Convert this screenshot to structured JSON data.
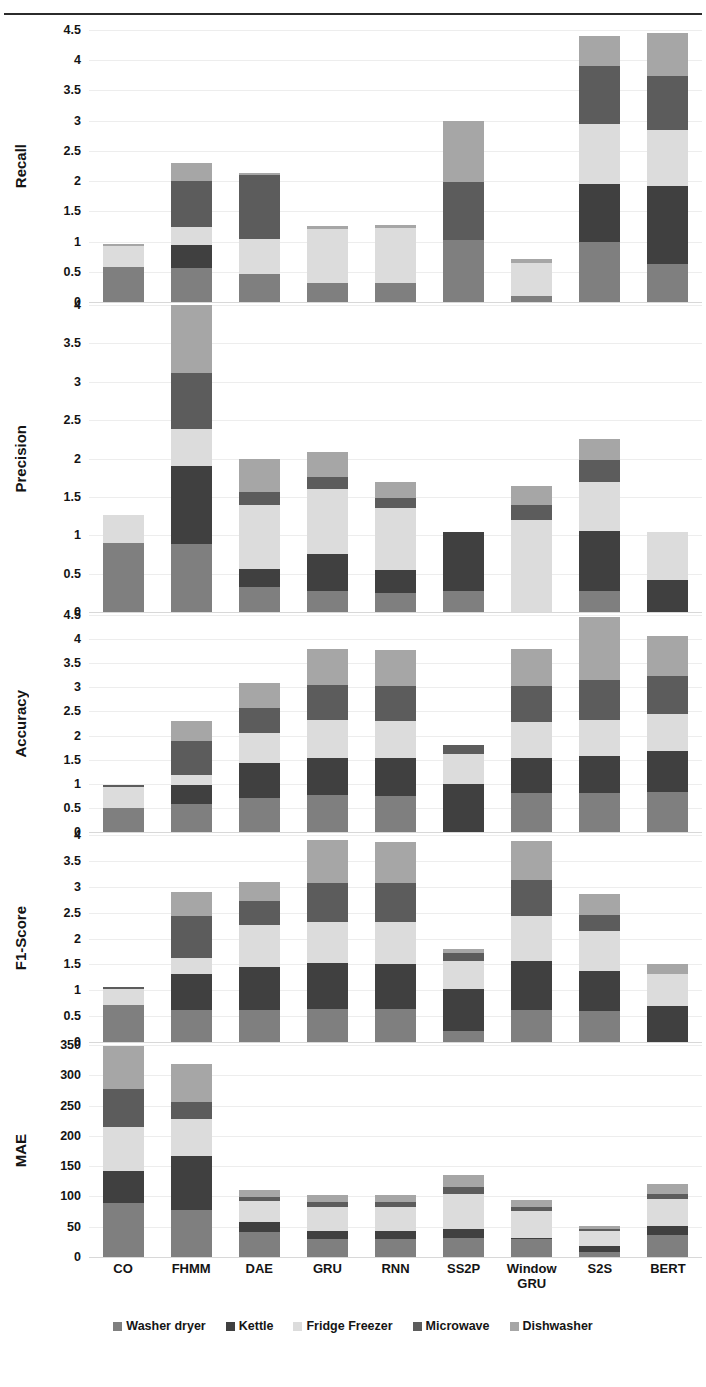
{
  "header": {
    "ghost_text": "",
    "rule": "horizontal-rule"
  },
  "xaxis": {
    "categories": [
      "CO",
      "FHMM",
      "DAE",
      "GRU",
      "RNN",
      "SS2P",
      "Window\nGRU",
      "S2S",
      "BERT"
    ]
  },
  "legend": {
    "items": [
      {
        "label": "Washer dryer",
        "color": "#7f7f7f"
      },
      {
        "label": "Kettle",
        "color": "#404040"
      },
      {
        "label": "Fridge Freezer",
        "color": "#dcdcdc"
      },
      {
        "label": "Microwave",
        "color": "#5c5c5c"
      },
      {
        "label": "Dishwasher",
        "color": "#a6a6a6"
      }
    ]
  },
  "colors": {
    "washer_dryer": "#7f7f7f",
    "kettle": "#404040",
    "fridge_freezer": "#dcdcdc",
    "microwave": "#5c5c5c",
    "dishwasher": "#a6a6a6",
    "gridline": "#ededed",
    "text": "#141414",
    "background": "#ffffff"
  },
  "chart_data": [
    {
      "type": "bar",
      "stacked": true,
      "title": "",
      "ylabel": "Recall",
      "xlabel": "",
      "ylim": [
        0,
        4.5
      ],
      "yticks": [
        0,
        0.5,
        1,
        1.5,
        2,
        2.5,
        3,
        3.5,
        4,
        4.5
      ],
      "grid": true,
      "legend_position": "bottom",
      "categories": [
        "CO",
        "FHMM",
        "DAE",
        "GRU",
        "RNN",
        "SS2P",
        "Window GRU",
        "S2S",
        "BERT"
      ],
      "series": [
        {
          "name": "Washer dryer",
          "values": [
            0.58,
            0.56,
            0.46,
            0.31,
            0.31,
            1.02,
            0.1,
            1.0,
            0.63
          ]
        },
        {
          "name": "Kettle",
          "values": [
            0.0,
            0.38,
            0.0,
            0.0,
            0.0,
            0.0,
            0.0,
            0.96,
            1.29
          ]
        },
        {
          "name": "Fridge Freezer",
          "values": [
            0.34,
            0.3,
            0.58,
            0.89,
            0.92,
            0.0,
            0.55,
            0.98,
            0.93
          ]
        },
        {
          "name": "Microwave",
          "values": [
            0.0,
            0.77,
            1.06,
            0.0,
            0.0,
            0.97,
            0.0,
            0.96,
            0.89
          ]
        },
        {
          "name": "Dishwasher",
          "values": [
            0.04,
            0.29,
            0.04,
            0.05,
            0.05,
            1.01,
            0.06,
            0.5,
            0.71
          ]
        }
      ],
      "totals": [
        0.96,
        2.3,
        2.14,
        1.25,
        1.28,
        3.0,
        0.71,
        4.4,
        4.45
      ]
    },
    {
      "type": "bar",
      "stacked": true,
      "title": "",
      "ylabel": "Precision",
      "xlabel": "",
      "ylim": [
        0,
        4
      ],
      "yticks": [
        0,
        0.5,
        1,
        1.5,
        2,
        2.5,
        3,
        3.5,
        4
      ],
      "grid": true,
      "legend_position": "bottom",
      "categories": [
        "CO",
        "FHMM",
        "DAE",
        "GRU",
        "RNN",
        "SS2P",
        "Window GRU",
        "S2S",
        "BERT"
      ],
      "series": [
        {
          "name": "Washer dryer",
          "values": [
            0.9,
            0.88,
            0.33,
            0.28,
            0.25,
            0.27,
            0.0,
            0.27,
            0.0
          ]
        },
        {
          "name": "Kettle",
          "values": [
            0.0,
            1.02,
            0.23,
            0.47,
            0.3,
            0.77,
            0.0,
            0.79,
            0.42
          ]
        },
        {
          "name": "Fridge Freezer",
          "values": [
            0.37,
            0.48,
            0.83,
            0.85,
            0.8,
            0.0,
            1.2,
            0.64,
            0.62
          ]
        },
        {
          "name": "Microwave",
          "values": [
            0.0,
            0.74,
            0.18,
            0.16,
            0.13,
            0.0,
            0.19,
            0.28,
            0.0
          ]
        },
        {
          "name": "Dishwasher",
          "values": [
            0.0,
            0.88,
            0.43,
            0.32,
            0.21,
            0.0,
            0.25,
            0.28,
            0.0
          ]
        }
      ],
      "totals": [
        1.27,
        4.0,
        2.0,
        2.08,
        1.69,
        1.04,
        2.64,
        2.26,
        1.04
      ]
    },
    {
      "type": "bar",
      "stacked": true,
      "title": "",
      "ylabel": "Accuracy",
      "xlabel": "",
      "ylim": [
        0,
        4.5
      ],
      "yticks": [
        0,
        0.5,
        1,
        1.5,
        2,
        2.5,
        3,
        3.5,
        4,
        4.5
      ],
      "grid": true,
      "legend_position": "bottom",
      "categories": [
        "CO",
        "FHMM",
        "DAE",
        "GRU",
        "RNN",
        "SS2P",
        "Window GRU",
        "S2S",
        "BERT"
      ],
      "series": [
        {
          "name": "Washer dryer",
          "values": [
            0.49,
            0.59,
            0.7,
            0.77,
            0.74,
            0.0,
            0.8,
            0.8,
            0.82
          ]
        },
        {
          "name": "Kettle",
          "values": [
            0.0,
            0.39,
            0.73,
            0.76,
            0.79,
            1.0,
            0.73,
            0.77,
            0.85
          ]
        },
        {
          "name": "Fridge Freezer",
          "values": [
            0.45,
            0.2,
            0.63,
            0.79,
            0.78,
            0.61,
            0.76,
            0.75,
            0.77
          ]
        },
        {
          "name": "Microwave",
          "values": [
            0.04,
            0.7,
            0.52,
            0.72,
            0.72,
            0.19,
            0.74,
            0.83,
            0.8
          ]
        },
        {
          "name": "Dishwasher",
          "values": [
            0.0,
            0.42,
            0.52,
            0.76,
            0.74,
            0.0,
            0.77,
            1.3,
            0.82
          ]
        }
      ],
      "totals": [
        0.98,
        2.3,
        3.1,
        3.8,
        3.77,
        1.8,
        3.8,
        4.45,
        4.06
      ]
    },
    {
      "type": "bar",
      "stacked": true,
      "title": "",
      "ylabel": "F1-Score",
      "xlabel": "",
      "ylim": [
        0,
        4
      ],
      "yticks": [
        0,
        0.5,
        1,
        1.5,
        2,
        2.5,
        3,
        3.5,
        4
      ],
      "grid": true,
      "legend_position": "bottom",
      "categories": [
        "CO",
        "FHMM",
        "DAE",
        "GRU",
        "RNN",
        "SS2P",
        "Window GRU",
        "S2S",
        "BERT"
      ],
      "series": [
        {
          "name": "Washer dryer",
          "values": [
            0.72,
            0.62,
            0.62,
            0.64,
            0.63,
            0.22,
            0.62,
            0.6,
            0.0
          ]
        },
        {
          "name": "Kettle",
          "values": [
            0.0,
            0.7,
            0.83,
            0.88,
            0.87,
            0.8,
            0.95,
            0.78,
            0.69
          ]
        },
        {
          "name": "Fridge Freezer",
          "values": [
            0.3,
            0.3,
            0.81,
            0.8,
            0.81,
            0.55,
            0.86,
            0.76,
            0.62
          ]
        },
        {
          "name": "Microwave",
          "values": [
            0.04,
            0.82,
            0.47,
            0.76,
            0.76,
            0.15,
            0.7,
            0.32,
            0.0
          ]
        },
        {
          "name": "Dishwasher",
          "values": [
            0.0,
            0.46,
            0.37,
            0.82,
            0.8,
            0.08,
            0.75,
            0.4,
            0.19
          ]
        }
      ],
      "totals": [
        1.06,
        2.9,
        3.1,
        3.9,
        3.87,
        1.8,
        3.88,
        2.86,
        1.5
      ]
    },
    {
      "type": "bar",
      "stacked": true,
      "title": "",
      "ylabel": "MAE",
      "xlabel": "",
      "ylim": [
        0,
        350
      ],
      "yticks": [
        0,
        50,
        100,
        150,
        200,
        250,
        300,
        350
      ],
      "grid": true,
      "legend_position": "bottom",
      "categories": [
        "CO",
        "FHMM",
        "DAE",
        "GRU",
        "RNN",
        "SS2P",
        "Window GRU",
        "S2S",
        "BERT"
      ],
      "series": [
        {
          "name": "Washer dryer",
          "values": [
            90,
            78,
            42,
            30,
            30,
            32,
            30,
            8,
            37
          ]
        },
        {
          "name": "Kettle",
          "values": [
            52,
            88,
            15,
            13,
            13,
            15,
            2,
            10,
            14
          ]
        },
        {
          "name": "Fridge Freezer",
          "values": [
            73,
            62,
            36,
            40,
            40,
            57,
            44,
            25,
            45
          ]
        },
        {
          "name": "Microwave",
          "values": [
            62,
            28,
            6,
            8,
            8,
            12,
            6,
            3,
            8
          ]
        },
        {
          "name": "Dishwasher",
          "values": [
            71,
            63,
            12,
            12,
            12,
            20,
            12,
            6,
            17
          ]
        }
      ],
      "totals": [
        348,
        319,
        111,
        103,
        103,
        136,
        94,
        52,
        121
      ]
    }
  ]
}
